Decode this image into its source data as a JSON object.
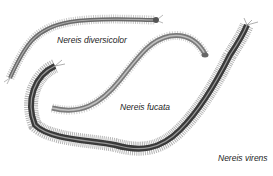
{
  "labels": {
    "diversicolor": "Nereis diversicolor",
    "fucata": "Nereis fucata",
    "virens": "Nereis virens"
  },
  "colors": {
    "background": "#ffffff",
    "worm_dark": "#2a2a2a",
    "worm_mid": "#777777",
    "worm_light": "#bbbbbb",
    "label": "#222222"
  }
}
